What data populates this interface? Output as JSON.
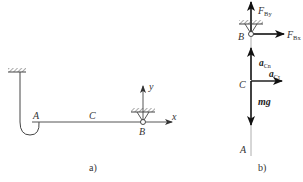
{
  "figure_a": {
    "caption": "a)",
    "points": {
      "A": "A",
      "C": "C",
      "B": "B"
    },
    "axes": {
      "x": "x",
      "y": "y"
    },
    "elements": [
      "hatched-ceiling-support",
      "rope-with-hook",
      "horizontal-rod",
      "pin-support-B"
    ]
  },
  "figure_b": {
    "caption": "b)",
    "points": {
      "B": "B",
      "C": "C",
      "A": "A"
    },
    "forces": {
      "F_By": {
        "main": "F",
        "sub": "By"
      },
      "F_Bx": {
        "main": "F",
        "sub": "Bx"
      },
      "mg": "mg"
    },
    "accelerations": {
      "a_Cn": {
        "main": "a",
        "sub": "Cn"
      },
      "a_Ct": {
        "main": "a",
        "sub": "Cτ"
      }
    }
  }
}
